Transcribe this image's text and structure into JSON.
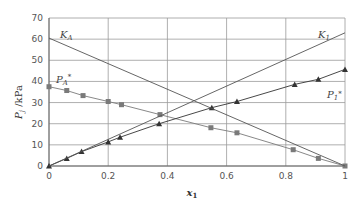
{
  "chart_data": {
    "type": "line",
    "title": "",
    "xlabel": "x1",
    "ylabel": "Pj /kPa",
    "xlim": [
      0,
      1
    ],
    "ylim": [
      0,
      70
    ],
    "x_ticks": [
      0,
      0.2,
      0.4,
      0.6,
      0.8,
      1
    ],
    "x_tick_labels": [
      "0",
      "0.2",
      "0.4",
      "0.6",
      "0.8",
      "1"
    ],
    "y_ticks": [
      0,
      10,
      20,
      30,
      40,
      50,
      60,
      70
    ],
    "y_tick_labels": [
      "0",
      "10",
      "20",
      "30",
      "40",
      "50",
      "60",
      "70"
    ],
    "grid": true,
    "legend": "inline labels",
    "series": [
      {
        "name": "PA*",
        "label": "PA*",
        "marker": "square",
        "color": "#7a7a7a",
        "x": [
          0,
          0.06,
          0.115,
          0.2,
          0.245,
          0.375,
          0.547,
          0.635,
          0.825,
          0.91,
          1.0
        ],
        "y": [
          37.5,
          35.7,
          33.3,
          30.5,
          29.0,
          24.3,
          18.1,
          15.7,
          7.7,
          3.6,
          0
        ]
      },
      {
        "name": "P1*",
        "label": "P1*",
        "marker": "triangle",
        "color": "#333333",
        "x": [
          0,
          0.06,
          0.11,
          0.2,
          0.24,
          0.372,
          0.55,
          0.635,
          0.83,
          0.91,
          1.0
        ],
        "y": [
          0,
          3.6,
          6.8,
          11.4,
          13.6,
          20.0,
          27.6,
          30.5,
          38.6,
          41.0,
          45.7
        ]
      },
      {
        "name": "KA",
        "label": "KA",
        "marker": "none",
        "color": "#555555",
        "x": [
          0,
          1
        ],
        "y": [
          60.5,
          0
        ]
      },
      {
        "name": "K1",
        "label": "K1",
        "marker": "none",
        "color": "#555555",
        "x": [
          0,
          1
        ],
        "y": [
          0,
          63
        ]
      }
    ]
  },
  "labels": {
    "ka": "K",
    "ka_sub": "A",
    "k1": "K",
    "k1_sub": "1",
    "pa": "P",
    "pa_sub": "A",
    "pa_sup": "*",
    "p1": "P",
    "p1_sub": "1",
    "p1_sup": "*",
    "ylabel_main": "P",
    "ylabel_sub": "j",
    "ylabel_unit": " /kPa",
    "xlabel_main": "x",
    "xlabel_sub": "1"
  }
}
